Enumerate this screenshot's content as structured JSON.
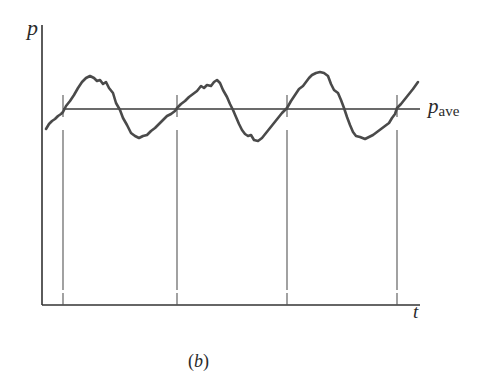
{
  "figure": {
    "caption_open": "(",
    "caption_letter": "b",
    "caption_close": ")",
    "y_axis_label": "p",
    "x_axis_label": "t",
    "average_label_main": "p",
    "average_label_sub": "ave"
  },
  "colors": {
    "axis": "#333333",
    "waveform": "#4a4a4a",
    "average_line": "#3a3a3a",
    "marker_lines": "#555555",
    "text": "#2a2a2a"
  },
  "chart_data": {
    "type": "line",
    "title": "",
    "xlabel": "t",
    "ylabel": "p",
    "average_line_label": "p_ave",
    "periods_shown": 3,
    "upward_crossing_markers_px_x": [
      63,
      177,
      287,
      397
    ],
    "waveform_px": [
      [
        46,
        129
      ],
      [
        49,
        124
      ],
      [
        52,
        121
      ],
      [
        55,
        119
      ],
      [
        58,
        116
      ],
      [
        61,
        114
      ],
      [
        63,
        112
      ],
      [
        66,
        106
      ],
      [
        70,
        101
      ],
      [
        74,
        95
      ],
      [
        78,
        88
      ],
      [
        82,
        82
      ],
      [
        86,
        78
      ],
      [
        90,
        76
      ],
      [
        94,
        78
      ],
      [
        97,
        81
      ],
      [
        100,
        80
      ],
      [
        103,
        84
      ],
      [
        106,
        82
      ],
      [
        109,
        88
      ],
      [
        113,
        93
      ],
      [
        116,
        103
      ],
      [
        120,
        110
      ],
      [
        123,
        118
      ],
      [
        127,
        125
      ],
      [
        131,
        133
      ],
      [
        135,
        136
      ],
      [
        139,
        138
      ],
      [
        143,
        136
      ],
      [
        147,
        135
      ],
      [
        151,
        131
      ],
      [
        155,
        128
      ],
      [
        159,
        124
      ],
      [
        163,
        120
      ],
      [
        167,
        116
      ],
      [
        171,
        114
      ],
      [
        175,
        111
      ],
      [
        177,
        108
      ],
      [
        181,
        104
      ],
      [
        185,
        101
      ],
      [
        189,
        97
      ],
      [
        193,
        94
      ],
      [
        197,
        91
      ],
      [
        201,
        86
      ],
      [
        204,
        88
      ],
      [
        207,
        85
      ],
      [
        211,
        86
      ],
      [
        214,
        82
      ],
      [
        217,
        80
      ],
      [
        220,
        83
      ],
      [
        223,
        90
      ],
      [
        227,
        97
      ],
      [
        230,
        104
      ],
      [
        233,
        110
      ],
      [
        236,
        117
      ],
      [
        239,
        124
      ],
      [
        242,
        130
      ],
      [
        245,
        134
      ],
      [
        248,
        136
      ],
      [
        251,
        135
      ],
      [
        254,
        140
      ],
      [
        258,
        141
      ],
      [
        262,
        138
      ],
      [
        266,
        133
      ],
      [
        270,
        128
      ],
      [
        274,
        123
      ],
      [
        278,
        118
      ],
      [
        282,
        113
      ],
      [
        287,
        108
      ],
      [
        291,
        101
      ],
      [
        295,
        95
      ],
      [
        299,
        89
      ],
      [
        303,
        86
      ],
      [
        306,
        82
      ],
      [
        309,
        78
      ],
      [
        312,
        75
      ],
      [
        316,
        73
      ],
      [
        320,
        72
      ],
      [
        324,
        73
      ],
      [
        328,
        76
      ],
      [
        331,
        84
      ],
      [
        334,
        90
      ],
      [
        338,
        93
      ],
      [
        341,
        100
      ],
      [
        344,
        108
      ],
      [
        347,
        117
      ],
      [
        350,
        125
      ],
      [
        353,
        132
      ],
      [
        356,
        136
      ],
      [
        360,
        137
      ],
      [
        365,
        139
      ],
      [
        369,
        137
      ],
      [
        373,
        135
      ],
      [
        377,
        132
      ],
      [
        381,
        129
      ],
      [
        385,
        126
      ],
      [
        389,
        123
      ],
      [
        392,
        118
      ],
      [
        395,
        114
      ],
      [
        397,
        108
      ],
      [
        401,
        104
      ],
      [
        405,
        99
      ],
      [
        409,
        94
      ],
      [
        413,
        89
      ],
      [
        418,
        82
      ]
    ],
    "average_line_px": {
      "x1": 63,
      "x2": 420,
      "y": 109
    },
    "axes_px": {
      "origin": [
        42,
        305
      ],
      "y_top": 25,
      "x_right": 420
    },
    "grid": false,
    "legend": "none"
  }
}
